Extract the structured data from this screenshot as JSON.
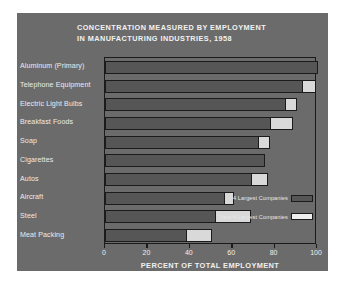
{
  "chart_data": {
    "type": "bar",
    "orientation": "horizontal",
    "stacked": true,
    "title": "CONCENTRATION MEASURED BY EMPLOYMENT IN MANUFACTURING INDUSTRIES, 1958",
    "title_line1": "CONCENTRATION MEASURED BY EMPLOYMENT",
    "title_line2": "IN MANUFACTURING INDUSTRIES, 1958",
    "xlabel": "PERCENT OF TOTAL EMPLOYMENT",
    "ylabel": "",
    "xlim": [
      0,
      100
    ],
    "xticks": [
      0,
      20,
      40,
      60,
      80,
      100
    ],
    "xticklabels": [
      "0",
      "20",
      "40",
      "60",
      "80",
      "100"
    ],
    "grid": false,
    "legend_position": "inside-bottom-right",
    "categories": [
      "Aluminum (Primary)",
      "Telephone Equipment",
      "Electric Light Bulbs",
      "Breakfast Foods",
      "Soap",
      "Cigarettes",
      "Autos",
      "Aircraft",
      "Steel",
      "Meat Packing"
    ],
    "series": [
      {
        "name": "4 Largest Companies",
        "color": "#565656",
        "values": [
          100,
          93,
          85,
          78,
          72,
          75,
          69,
          56,
          52,
          38
        ]
      },
      {
        "name": "Next 4 Largest Companies",
        "color": "#d9d9d9",
        "values": [
          0,
          6,
          5,
          10,
          5,
          0,
          7,
          4,
          16,
          12
        ]
      }
    ]
  },
  "colors": {
    "panel_background": "#6b6b6b",
    "page_background": "#ffffff",
    "frame": "#1b1b1b",
    "bar_dark": "#565656",
    "bar_light": "#d9d9d9",
    "text_light": "#f0f0f0"
  }
}
